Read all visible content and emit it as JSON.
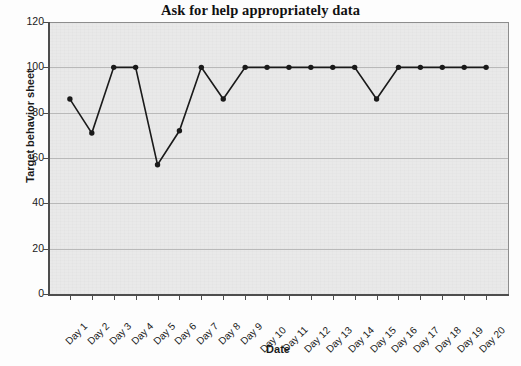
{
  "chart_data": {
    "type": "line",
    "title": "Ask for help appropriately data",
    "xlabel": "Date",
    "ylabel": "Target behavior sheet",
    "categories": [
      "Day 1",
      "Day 2",
      "Day 3",
      "Day 4",
      "Day 5",
      "Day 6",
      "Day 7",
      "Day 8",
      "Day 9",
      "Day 10",
      "Day 11",
      "Day 12",
      "Day 13",
      "Day 14",
      "Day 15",
      "Day 16",
      "Day 17",
      "Day 18",
      "Day 19",
      "Day 20"
    ],
    "values": [
      86,
      71,
      100,
      100,
      57,
      72,
      100,
      86,
      100,
      100,
      100,
      100,
      100,
      100,
      86,
      100,
      100,
      100,
      100,
      100
    ],
    "series": [
      {
        "name": "Target behavior sheet",
        "values": [
          86,
          71,
          100,
          100,
          57,
          72,
          100,
          86,
          100,
          100,
          100,
          100,
          100,
          100,
          86,
          100,
          100,
          100,
          100,
          100
        ]
      }
    ],
    "ylim": [
      0,
      120
    ],
    "yticks": [
      0,
      20,
      40,
      60,
      80,
      100,
      120
    ],
    "ytick_labels": [
      "0",
      "20",
      "40",
      "60",
      "80",
      "100",
      "120"
    ],
    "grid": true,
    "grid_axis": "y",
    "legend": false,
    "legend_position": "none",
    "marker": "filled-circle",
    "line_color": "#1a1a1a",
    "marker_color": "#1a1a1a",
    "plot_background": "#e9e9e9"
  },
  "axes": {
    "y_title": "Target behavior sheet",
    "x_title": "Date"
  }
}
